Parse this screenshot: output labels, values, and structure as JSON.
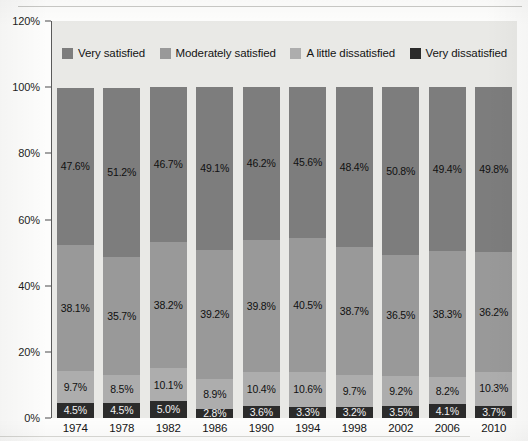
{
  "chart_data": {
    "type": "bar",
    "stacked": true,
    "title": "",
    "xlabel": "",
    "ylabel": "",
    "ylim": [
      0,
      120
    ],
    "ytick_labels": [
      "0%",
      "20%",
      "40%",
      "60%",
      "80%",
      "100%",
      "120%"
    ],
    "ytick_values": [
      0,
      20,
      40,
      60,
      80,
      100,
      120
    ],
    "grid": false,
    "legend_position": "top-inside",
    "categories": [
      "1974",
      "1978",
      "1982",
      "1986",
      "1990",
      "1994",
      "1998",
      "2002",
      "2006",
      "2010"
    ],
    "series": [
      {
        "name": "Very satisfied",
        "color": "#7d7d7d",
        "values": [
          47.6,
          51.2,
          46.7,
          49.1,
          46.2,
          45.6,
          48.4,
          50.8,
          49.4,
          49.8
        ],
        "labels": [
          "47.6%",
          "51.2%",
          "46.7%",
          "49.1%",
          "46.2%",
          "45.6%",
          "48.4%",
          "50.8%",
          "49.4%",
          "49.8%"
        ]
      },
      {
        "name": "Moderately satisfied",
        "color": "#999999",
        "values": [
          38.1,
          35.7,
          38.2,
          39.2,
          39.8,
          40.5,
          38.7,
          36.5,
          38.3,
          36.2
        ],
        "labels": [
          "38.1%",
          "35.7%",
          "38.2%",
          "39.2%",
          "39.8%",
          "40.5%",
          "38.7%",
          "36.5%",
          "38.3%",
          "36.2%"
        ]
      },
      {
        "name": "A little dissatisfied",
        "color": "#adadad",
        "values": [
          9.7,
          8.5,
          10.1,
          8.9,
          10.4,
          10.6,
          9.7,
          9.2,
          8.2,
          10.3
        ],
        "labels": [
          "9.7%",
          "8.5%",
          "10.1%",
          "8.9%",
          "10.4%",
          "10.6%",
          "9.7%",
          "9.2%",
          "8.2%",
          "10.3%"
        ]
      },
      {
        "name": "Very dissatisfied",
        "color": "#2b2b2b",
        "values": [
          4.5,
          4.5,
          5.0,
          2.8,
          3.6,
          3.3,
          3.2,
          3.5,
          4.1,
          3.7
        ],
        "labels": [
          "4.5%",
          "4.5%",
          "5.0%",
          "2.8%",
          "3.6%",
          "3.3%",
          "3.2%",
          "3.5%",
          "4.1%",
          "3.7%"
        ]
      }
    ],
    "legend": [
      {
        "label": "Very satisfied",
        "color": "#7d7d7d"
      },
      {
        "label": "Moderately satisfied",
        "color": "#999999"
      },
      {
        "label": "A little dissatisfied",
        "color": "#adadad"
      },
      {
        "label": "Very dissatisfied",
        "color": "#2b2b2b"
      }
    ],
    "plot_background": "#e9e9e6",
    "axis_color": "#5a5a5a"
  }
}
